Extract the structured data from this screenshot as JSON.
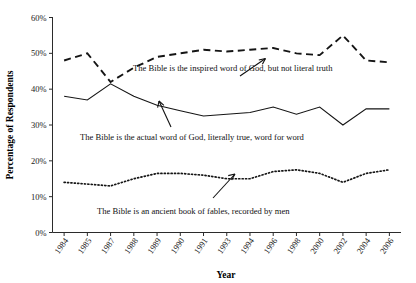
{
  "chart_data": {
    "type": "line",
    "title": "",
    "xlabel": "Year",
    "ylabel": "Percentage of Respondents",
    "categories": [
      "1984",
      "1985",
      "1987",
      "1988",
      "1989",
      "1990",
      "1991",
      "1993",
      "1994",
      "1996",
      "1998",
      "2000",
      "2002",
      "2004",
      "2006"
    ],
    "ylim": [
      0,
      60
    ],
    "ytick_labels": [
      "0%",
      "10%",
      "20%",
      "30%",
      "40%",
      "50%",
      "60%"
    ],
    "ytick_values": [
      0,
      10,
      20,
      30,
      40,
      50,
      60
    ],
    "grid": false,
    "legend": "annotations-inline",
    "series": [
      {
        "name": "The Bible is the inspired word of God, but not literal truth",
        "style": "dashed",
        "values": [
          48,
          50,
          42,
          46,
          49,
          50,
          51,
          50.5,
          51,
          51.5,
          50,
          49.5,
          55,
          48,
          47.5
        ]
      },
      {
        "name": "The Bible is the actual word of God, literally true, word for word",
        "style": "solid",
        "values": [
          38,
          37,
          41.5,
          38,
          35.5,
          34,
          32.5,
          33,
          33.5,
          35,
          33,
          35,
          30,
          34.5,
          34.5
        ]
      },
      {
        "name": "The Bible is an ancient book of fables, recorded by men",
        "style": "dotted",
        "values": [
          14,
          13.5,
          13,
          15,
          16.5,
          16.5,
          16,
          15,
          15,
          17,
          17.5,
          16.5,
          14,
          16.5,
          17.5
        ]
      }
    ],
    "annotations": [
      {
        "id": "annotation-inspired",
        "text": "The Bible is the inspired word of God, but not literal truth",
        "points_to_category": "1996"
      },
      {
        "id": "annotation-literal",
        "text": "The Bible is the actual word of God, literally true, word for word",
        "points_to_category": "1996"
      },
      {
        "id": "annotation-fables",
        "text": "The Bible is an ancient book of fables, recorded by men",
        "points_to_category": "1994"
      }
    ]
  }
}
